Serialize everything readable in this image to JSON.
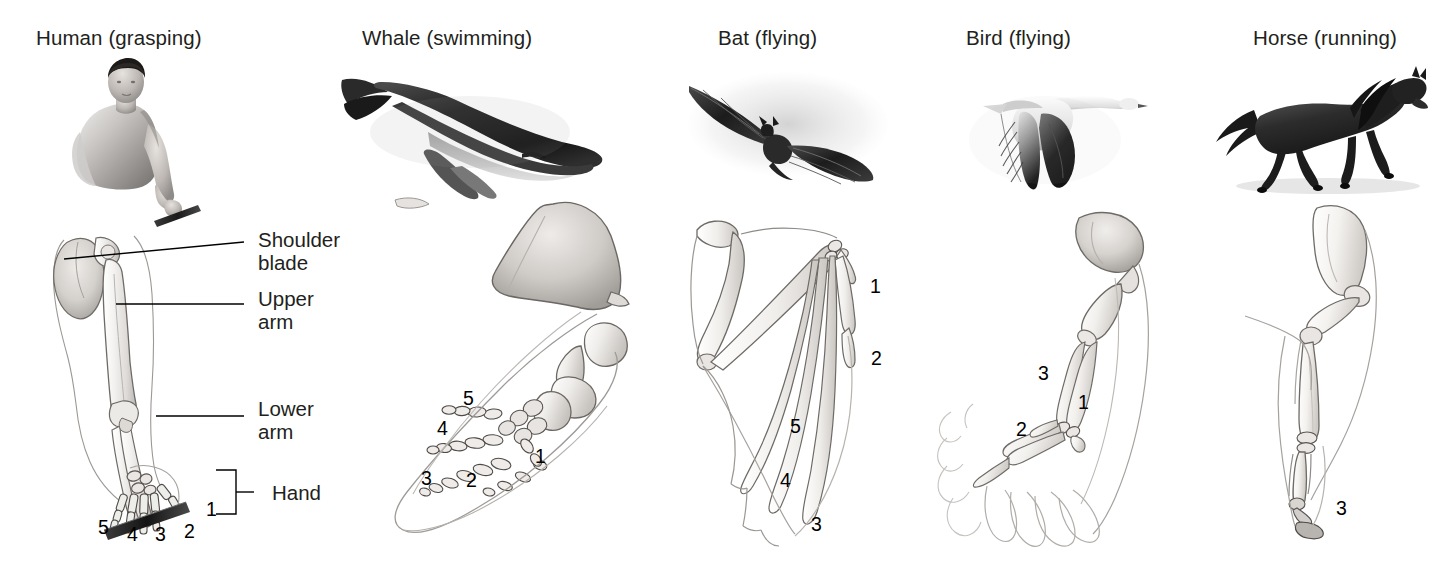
{
  "figure": {
    "background_color": "#ffffff",
    "width": 1441,
    "height": 570
  },
  "panels": [
    {
      "id": "human",
      "title": "Human (grasping)",
      "organism_icon": "human-figure-holding-rod-image",
      "limb_icon": "human-arm-skeleton-image",
      "digits": [
        {
          "label": "5",
          "x": 98,
          "y": 527
        },
        {
          "label": "4",
          "x": 127,
          "y": 534
        },
        {
          "label": "3",
          "x": 155,
          "y": 534
        },
        {
          "label": "2",
          "x": 184,
          "y": 531
        },
        {
          "label": "1",
          "x": 206,
          "y": 509
        }
      ],
      "callouts": [
        {
          "id": "shoulder-blade",
          "label": "Shoulder\nblade",
          "x": 258,
          "y": 228
        },
        {
          "id": "upper-arm",
          "label": "Upper\narm",
          "x": 258,
          "y": 287
        },
        {
          "id": "lower-arm",
          "label": "Lower\narm",
          "x": 258,
          "y": 397
        },
        {
          "id": "hand",
          "label": "Hand",
          "x": 272,
          "y": 487
        }
      ]
    },
    {
      "id": "whale",
      "title": "Whale (swimming)",
      "organism_icon": "humpback-whale-image",
      "limb_icon": "whale-flipper-skeleton-image",
      "digits": [
        {
          "label": "5",
          "x": 463,
          "y": 398
        },
        {
          "label": "4",
          "x": 437,
          "y": 428
        },
        {
          "label": "3",
          "x": 421,
          "y": 478
        },
        {
          "label": "2",
          "x": 466,
          "y": 480
        },
        {
          "label": "1",
          "x": 535,
          "y": 456
        }
      ],
      "callouts": []
    },
    {
      "id": "bat",
      "title": "Bat (flying)",
      "organism_icon": "bat-in-flight-image",
      "limb_icon": "bat-wing-skeleton-image",
      "digits": [
        {
          "label": "1",
          "x": 870,
          "y": 286
        },
        {
          "label": "2",
          "x": 871,
          "y": 358
        },
        {
          "label": "5",
          "x": 790,
          "y": 426
        },
        {
          "label": "4",
          "x": 780,
          "y": 480
        },
        {
          "label": "3",
          "x": 811,
          "y": 524
        }
      ],
      "callouts": []
    },
    {
      "id": "bird",
      "title": "Bird (flying)",
      "organism_icon": "goose-in-flight-image",
      "limb_icon": "bird-wing-skeleton-image",
      "digits": [
        {
          "label": "3",
          "x": 1038,
          "y": 373
        },
        {
          "label": "1",
          "x": 1078,
          "y": 402
        },
        {
          "label": "2",
          "x": 1016,
          "y": 429
        }
      ],
      "callouts": []
    },
    {
      "id": "horse",
      "title": "Horse (running)",
      "organism_icon": "running-horse-image",
      "limb_icon": "horse-leg-skeleton-image",
      "digits": [
        {
          "label": "3",
          "x": 1336,
          "y": 508
        }
      ],
      "callouts": []
    }
  ],
  "title_positions": {
    "human": 36,
    "whale": 362,
    "bat": 718,
    "bird": 966,
    "horse": 1253
  }
}
